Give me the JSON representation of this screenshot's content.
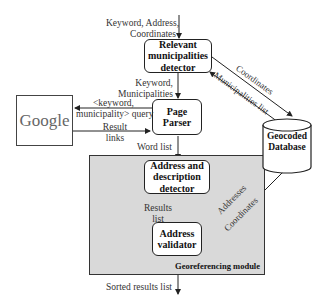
{
  "diagram": {
    "inputs_label": [
      "Keyword, Address,",
      "Coordinates"
    ],
    "nodes": {
      "municipalities_detector": "Relevant municipalities detector",
      "page_parser": "Page Parser",
      "address_detector": "Address and description detector",
      "address_validator": "Address validator",
      "google": "Google",
      "database": [
        "Geocoded",
        "Database"
      ]
    },
    "module_label": "Georeferencing module",
    "edges": {
      "keyword_municipalities": [
        "Keyword,",
        "Municipalities"
      ],
      "query": [
        "<keyword,",
        "municipality> query"
      ],
      "result_links": [
        "Result",
        "links"
      ],
      "word_list": "Word list",
      "results_list": [
        "Results",
        "list"
      ],
      "sorted_results": "Sorted results list",
      "coordinates_top": "Coordinates",
      "municipalities_list": "Municipalities list",
      "addresses": "Addresses",
      "coordinates_bottom": "Coordinates"
    }
  }
}
